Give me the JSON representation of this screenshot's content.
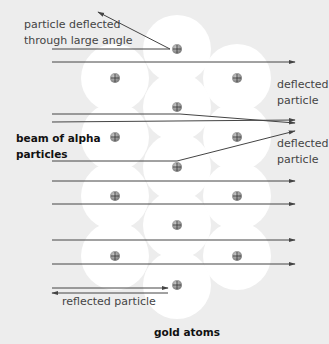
{
  "diagram": {
    "background_color": "#ededed",
    "atom_color": "#ffffff",
    "line_color": "#444444",
    "labels": {
      "large_angle_1": "particle deflected",
      "large_angle_2": "through large angle",
      "deflected_top_1": "deflected",
      "deflected_top_2": "particle",
      "beam_1": "beam of alpha",
      "beam_2": "particles",
      "deflected_bottom_1": "deflected",
      "deflected_bottom_2": "particle",
      "reflected": "reflected particle",
      "gold_atoms": "gold atoms"
    },
    "nucleus_symbol": "plus-charge",
    "nuclei": [
      {
        "x": 177,
        "y": 49
      },
      {
        "x": 115,
        "y": 78
      },
      {
        "x": 237,
        "y": 78
      },
      {
        "x": 177,
        "y": 107
      },
      {
        "x": 115,
        "y": 137
      },
      {
        "x": 237,
        "y": 137
      },
      {
        "x": 177,
        "y": 167
      },
      {
        "x": 115,
        "y": 196
      },
      {
        "x": 237,
        "y": 196
      },
      {
        "x": 177,
        "y": 225
      },
      {
        "x": 115,
        "y": 256
      },
      {
        "x": 237,
        "y": 256
      },
      {
        "x": 177,
        "y": 285
      }
    ],
    "paths": [
      {
        "name": "large-angle-deflection",
        "points": [
          [
            52,
            49
          ],
          [
            170,
            49
          ],
          [
            98,
            12
          ]
        ]
      },
      {
        "name": "undeflected-1",
        "points": [
          [
            52,
            62
          ],
          [
            295,
            62
          ]
        ]
      },
      {
        "name": "slight-deflection-down",
        "points": [
          [
            52,
            114
          ],
          [
            180,
            114
          ],
          [
            295,
            123
          ]
        ]
      },
      {
        "name": "undeflected-2",
        "points": [
          [
            52,
            122
          ],
          [
            295,
            120
          ]
        ]
      },
      {
        "name": "deflection-up",
        "points": [
          [
            52,
            161
          ],
          [
            177,
            161
          ],
          [
            295,
            131
          ]
        ]
      },
      {
        "name": "undeflected-3",
        "points": [
          [
            52,
            181
          ],
          [
            295,
            181
          ]
        ]
      },
      {
        "name": "undeflected-4",
        "points": [
          [
            52,
            204
          ],
          [
            295,
            204
          ]
        ]
      },
      {
        "name": "undeflected-5",
        "points": [
          [
            52,
            240
          ],
          [
            295,
            240
          ]
        ]
      },
      {
        "name": "undeflected-6",
        "points": [
          [
            52,
            264
          ],
          [
            295,
            264
          ]
        ]
      },
      {
        "name": "incoming-to-reflect",
        "points": [
          [
            52,
            288
          ],
          [
            168,
            288
          ]
        ]
      },
      {
        "name": "reflected-back",
        "points": [
          [
            168,
            293
          ],
          [
            52,
            293
          ]
        ]
      }
    ]
  }
}
